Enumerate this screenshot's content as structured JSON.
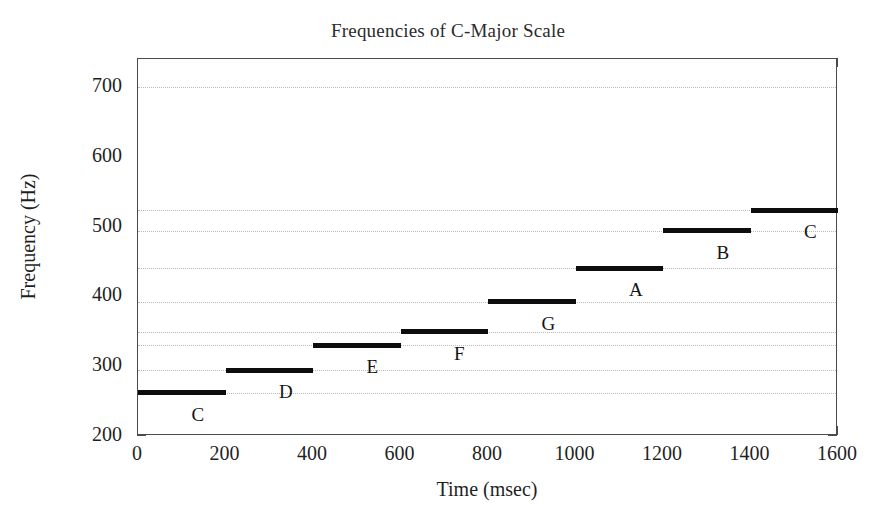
{
  "chart_data": {
    "type": "bar",
    "title": "Frequencies of C-Major Scale",
    "xlabel": "Time (msec)",
    "ylabel": "Frequency (Hz)",
    "xlim": [
      0,
      1600
    ],
    "ylim": [
      200,
      740
    ],
    "xticks": [
      0,
      200,
      400,
      600,
      800,
      1000,
      1200,
      1400,
      1600
    ],
    "yticks": [
      200,
      300,
      400,
      500,
      600,
      700
    ],
    "grid": "horizontal-dotted-at-note-frequencies",
    "legend": "none",
    "orientation": "horizontal-segments",
    "categories": [
      "C",
      "D",
      "E",
      "F",
      "G",
      "A",
      "B",
      "C"
    ],
    "values": [
      262,
      294,
      330,
      349,
      392,
      440,
      494,
      523
    ],
    "segments": [
      {
        "label": "C",
        "x_start": 0,
        "x_end": 200,
        "frequency": 262
      },
      {
        "label": "D",
        "x_start": 200,
        "x_end": 400,
        "frequency": 294
      },
      {
        "label": "E",
        "x_start": 400,
        "x_end": 600,
        "frequency": 330
      },
      {
        "label": "F",
        "x_start": 600,
        "x_end": 800,
        "frequency": 349
      },
      {
        "label": "G",
        "x_start": 800,
        "x_end": 1000,
        "frequency": 392
      },
      {
        "label": "A",
        "x_start": 1000,
        "x_end": 1200,
        "frequency": 440
      },
      {
        "label": "B",
        "x_start": 1200,
        "x_end": 1400,
        "frequency": 494
      },
      {
        "label": "C",
        "x_start": 1400,
        "x_end": 1600,
        "frequency": 523
      }
    ],
    "gridline_values": [
      262,
      294,
      330,
      349,
      392,
      440,
      494,
      523,
      700
    ],
    "series_color": "#0d0d0d",
    "grid_color": "#b9b9b9",
    "axis_color": "#4a4a4a"
  },
  "axes": {
    "ytick_labels": [
      "700",
      "600",
      "500",
      "400",
      "300",
      "200"
    ],
    "xtick_labels": [
      "0",
      "200",
      "400",
      "600",
      "800",
      "1000",
      "1200",
      "1400",
      "1600"
    ]
  }
}
